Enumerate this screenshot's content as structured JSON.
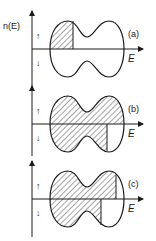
{
  "figure": {
    "y_axis_label": "n(E)",
    "x_axis_label": "E",
    "spin_up_symbol": "↑",
    "spin_down_symbol": "↓",
    "colors": {
      "ink": "#1a1a1a",
      "background": "#ffffff"
    },
    "panels": [
      {
        "id": "a",
        "label": "(a)",
        "axis_y": 49,
        "upper_fill_to": 73,
        "lower_fill_to": null
      },
      {
        "id": "b",
        "label": "(b)",
        "axis_y": 124,
        "upper_fill_to": 124,
        "lower_fill_to": 107
      },
      {
        "id": "c",
        "label": "(c)",
        "axis_y": 199,
        "upper_fill_to": 116,
        "lower_fill_to": 101
      }
    ]
  }
}
